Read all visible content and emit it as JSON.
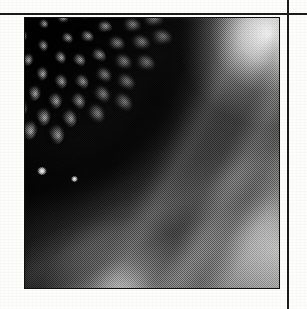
{
  "page": {
    "kind": "scanned-page",
    "background_color": "#fdfdfc",
    "width": 307,
    "height": 309,
    "caption_text": ""
  },
  "rules": {
    "color": "#1b1b1b",
    "horizontal": {
      "y": 13,
      "thickness": 2,
      "x_start": 0,
      "x_end": 307
    },
    "vertical": {
      "x": 287,
      "thickness": 2,
      "y_start": 0,
      "y_end": 309
    }
  },
  "photo": {
    "subject": "sunflower seed head",
    "description": "Close-up black and white halftone photograph of a sunflower capitulum showing the spiral phyllotaxis arrangement of disc florets, with blurred bright ray petals at right and bottom.",
    "tone": "grayscale-halftone",
    "frame": {
      "left": 25,
      "top": 18,
      "width": 254,
      "height": 270
    },
    "border_color": "#101010",
    "darkest_value": "#000000",
    "brightest_value": "#f2f2f2",
    "spiral_center": {
      "x": 0.02,
      "y": -0.04
    },
    "floret_count": 132,
    "highlights": [
      {
        "x": 0.066,
        "y": 0.565,
        "size": 10
      },
      {
        "x": 0.196,
        "y": 0.596,
        "size": 7
      }
    ]
  },
  "icons": {
    "photograph": "photograph-icon"
  }
}
